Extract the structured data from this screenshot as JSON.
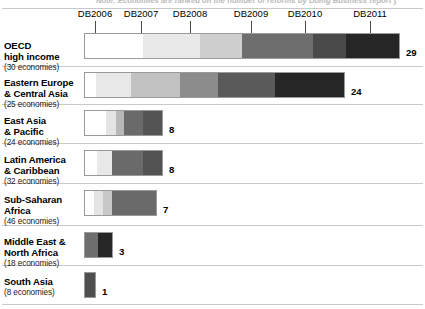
{
  "top_caption": "Note: Economies are ranked on the number of reforms by Doing Business report year",
  "axis": {
    "ticks": [
      {
        "label": "DB2006",
        "x": 95
      },
      {
        "label": "DB2007",
        "x": 141
      },
      {
        "label": "DB2008",
        "x": 190
      },
      {
        "label": "DB2009",
        "x": 251
      },
      {
        "label": "DB2010",
        "x": 305
      },
      {
        "label": "DB2011",
        "x": 370
      }
    ]
  },
  "chart_data": {
    "type": "bar",
    "title": "Note: Economies are ranked on the number of reforms by Doing Business report year",
    "xlabel": "",
    "ylabel": "",
    "orientation": "horizontal",
    "stacked": true,
    "grid": false,
    "legend_position": "top",
    "categories": [
      "OECD high income",
      "Eastern Europe & Central Asia",
      "East Asia & Pacific",
      "Latin America & Caribbean",
      "Sub-Saharan Africa",
      "Middle East & North Africa",
      "South Asia"
    ],
    "series": [
      {
        "name": "DB2006",
        "color": "#ffffff",
        "values": [
          5.5,
          1.2,
          2.8,
          1.3,
          0.9,
          0.0,
          0.0
        ]
      },
      {
        "name": "DB2007",
        "color": "#e8e8e8",
        "values": [
          5.0,
          4.0,
          1.2,
          2.2,
          1.1,
          0.0,
          0.0
        ]
      },
      {
        "name": "DB2008",
        "color": "#cfcfcf",
        "values": [
          3.6,
          5.8,
          1.0,
          0.0,
          1.0,
          0.0,
          0.0
        ]
      },
      {
        "name": "DB2009",
        "color": "#6e6e6e",
        "values": [
          6.2,
          4.6,
          1.7,
          3.0,
          4.0,
          1.1,
          0.0
        ]
      },
      {
        "name": "DB2010",
        "color": "#4a4a4a",
        "values": [
          3.0,
          6.7,
          1.3,
          1.5,
          0.0,
          0.0,
          1.0
        ]
      },
      {
        "name": "DB2011",
        "color": "#262626",
        "values": [
          5.7,
          1.7,
          0.0,
          0.0,
          0.0,
          1.9,
          0.0
        ]
      }
    ],
    "totals": [
      29,
      24,
      8,
      8,
      7,
      3,
      1
    ],
    "economies": [
      30,
      25,
      24,
      32,
      46,
      18,
      8
    ]
  },
  "rows": [
    {
      "name_line1": "OECD",
      "name_line2": "high income",
      "economies": "(30 economies)",
      "value": "29",
      "bar_width": 316,
      "segments": [
        {
          "color": "#ffffff",
          "width": 58
        },
        {
          "color": "#e8e8e8",
          "width": 58
        },
        {
          "color": "#cfcfcf",
          "width": 42
        },
        {
          "color": "#6e6e6e",
          "width": 71
        },
        {
          "color": "#4a4a4a",
          "width": 34
        },
        {
          "color": "#262626",
          "width": 53
        }
      ]
    },
    {
      "name_line1": "Eastern Europe",
      "name_line2": "& Central Asia",
      "economies": "(25 economies)",
      "value": "24",
      "bar_width": 261,
      "segments": [
        {
          "color": "#ffffff",
          "width": 11
        },
        {
          "color": "#e8e8e8",
          "width": 35
        },
        {
          "color": "#c2c2c2",
          "width": 50
        },
        {
          "color": "#8c8c8c",
          "width": 38
        },
        {
          "color": "#5a5a5a",
          "width": 57
        },
        {
          "color": "#262626",
          "width": 70
        }
      ]
    },
    {
      "name_line1": "East Asia",
      "name_line2": "& Pacific",
      "economies": "(24 economies)",
      "value": "8",
      "bar_width": 79,
      "segments": [
        {
          "color": "#ffffff",
          "width": 22
        },
        {
          "color": "#e4e4e4",
          "width": 10
        },
        {
          "color": "#b8b8b8",
          "width": 8
        },
        {
          "color": "#6a6a6a",
          "width": 20
        },
        {
          "color": "#545454",
          "width": 19
        }
      ]
    },
    {
      "name_line1": "Latin America",
      "name_line2": "& Caribbean",
      "economies": "(32 economies)",
      "value": "8",
      "bar_width": 79,
      "segments": [
        {
          "color": "#ffffff",
          "width": 12
        },
        {
          "color": "#e8e8e8",
          "width": 16
        },
        {
          "color": "#6a6a6a",
          "width": 31
        },
        {
          "color": "#525252",
          "width": 20
        }
      ]
    },
    {
      "name_line1": "Sub-Saharan",
      "name_line2": "Africa",
      "economies": "(46 economies)",
      "value": "7",
      "bar_width": 73,
      "segments": [
        {
          "color": "#ffffff",
          "width": 9
        },
        {
          "color": "#e4e4e4",
          "width": 9
        },
        {
          "color": "#c8c8c8",
          "width": 10
        },
        {
          "color": "#6a6a6a",
          "width": 45
        }
      ]
    },
    {
      "name_line1": "Middle East &",
      "name_line2": "North Africa",
      "economies": "(18 economies)",
      "value": "3",
      "bar_width": 29,
      "segments": [
        {
          "color": "#6e6e6e",
          "width": 14
        },
        {
          "color": "#262626",
          "width": 15
        }
      ]
    },
    {
      "name_line1": "South Asia",
      "name_line2": "",
      "economies": "(8 economies)",
      "value": "1",
      "bar_width": 12,
      "segments": [
        {
          "color": "#4f4f4f",
          "width": 12
        }
      ]
    }
  ],
  "row_geometry": [
    {
      "rule_y": 8,
      "bar_y": 33,
      "label_y": 29
    },
    {
      "rule_y": 66,
      "bar_y": 72,
      "label_y": 66
    },
    {
      "rule_y": 104,
      "bar_y": 110,
      "label_y": 104
    },
    {
      "rule_y": 143,
      "bar_y": 150,
      "label_y": 143
    },
    {
      "rule_y": 183,
      "bar_y": 190,
      "label_y": 183
    },
    {
      "rule_y": 225,
      "bar_y": 232,
      "label_y": 225
    },
    {
      "rule_y": 265,
      "bar_y": 272,
      "label_y": 265
    },
    {
      "rule_y": 304,
      "bar_y": -1,
      "label_y": -1
    }
  ]
}
